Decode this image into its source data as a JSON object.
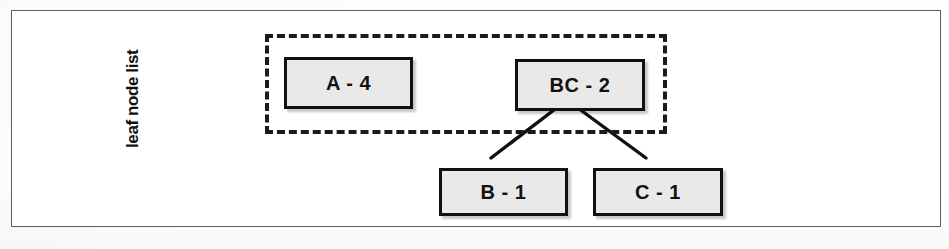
{
  "figure": {
    "width": 949,
    "height": 249,
    "background_color": "#fdfdfd",
    "frame_color": "#5d5f63"
  },
  "group": {
    "label": "leaf node list",
    "border_style": "dashed",
    "border_color": "#1b1b1b",
    "contains": [
      "A - 4",
      "BC - 2"
    ]
  },
  "nodes": [
    {
      "id": "a4",
      "label": "A - 4",
      "fill": "#e9e9e9",
      "stroke": "#101010"
    },
    {
      "id": "bc2",
      "label": "BC - 2",
      "fill": "#e9e9e9",
      "stroke": "#101010"
    },
    {
      "id": "b1",
      "label": "B - 1",
      "fill": "#e9e9e9",
      "stroke": "#101010"
    },
    {
      "id": "c1",
      "label": "C - 1",
      "fill": "#e9e9e9",
      "stroke": "#101010"
    }
  ],
  "edges": [
    {
      "from": "bc2",
      "to": "b1"
    },
    {
      "from": "bc2",
      "to": "c1"
    }
  ]
}
